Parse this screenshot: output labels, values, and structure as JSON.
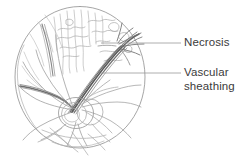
{
  "figure": {
    "type": "medical-line-illustration",
    "background_color": "#ffffff",
    "ink_color": "#8a8a8a",
    "dark_ink_color": "#4f4f4f",
    "text_color": "#3b3b3b",
    "leader_line_color": "#9a9a9a"
  },
  "labels": {
    "necrosis": {
      "text": "Necrosis",
      "leader_from_x": 101,
      "leader_to_x": 181,
      "leader_y": 43
    },
    "vascular_sheathing": {
      "line1": "Vascular",
      "line2": "sheathing",
      "leader_from_x": 101,
      "leader_to_x": 181,
      "leader_y": 73
    }
  },
  "structures": {
    "fundus_circle": {
      "name": "fundus-circle",
      "center_x": 80,
      "center_y": 77,
      "radius_x": 65,
      "radius_y": 71
    },
    "optic_disc": {
      "name": "optic-disc",
      "center_x": 76,
      "center_y": 113,
      "radius_x": 17,
      "radius_y": 15
    },
    "sheathed_vessel": {
      "name": "sheathed-vessel",
      "description": "thick dark vessel running from lower-left to upper-right"
    }
  }
}
